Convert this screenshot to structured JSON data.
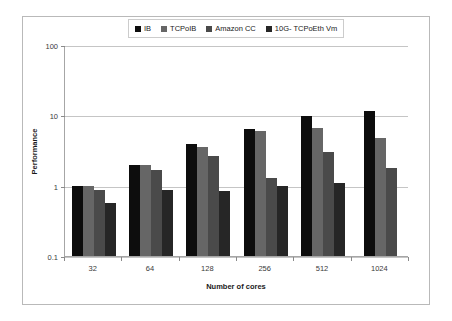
{
  "chart_data": {
    "type": "bar",
    "title": "",
    "subtitle": "",
    "xlabel": "Number of cores",
    "ylabel": "Performance",
    "categories": [
      "32",
      "64",
      "128",
      "256",
      "512",
      "1024"
    ],
    "yscale": "log",
    "ylim": [
      0.1,
      100
    ],
    "yticks": [
      "0.1",
      "1",
      "10",
      "100"
    ],
    "ytick_values": [
      0.1,
      1,
      10,
      100
    ],
    "grid": true,
    "legend_position": "top-center",
    "series": [
      {
        "name": "IB",
        "color": "#0d0d0d",
        "values": [
          1.0,
          2.0,
          3.9,
          6.3,
          9.9,
          11.7
        ]
      },
      {
        "name": "TCPoIB",
        "color": "#666666",
        "values": [
          1.0,
          1.95,
          3.6,
          5.9,
          6.7,
          4.7
        ]
      },
      {
        "name": "Amazon CC",
        "color": "#4a4a4a",
        "values": [
          0.88,
          1.65,
          2.6,
          1.3,
          3.0,
          1.8
        ]
      },
      {
        "name": "10G- TCPoEth Vm",
        "color": "#262626",
        "values": [
          0.57,
          0.88,
          0.83,
          0.98,
          1.1,
          null
        ]
      }
    ]
  },
  "legend": {
    "entries": [
      {
        "label": "IB",
        "color": "#0d0d0d"
      },
      {
        "label": "TCPoIB",
        "color": "#666666"
      },
      {
        "label": "Amazon CC",
        "color": "#4a4a4a"
      },
      {
        "label": "10G- TCPoEth Vm",
        "color": "#262626"
      }
    ]
  },
  "axes": {
    "y_title": "Performance",
    "x_title": "Number of cores",
    "y_tick_labels": [
      "100",
      "10",
      "1",
      "0.1"
    ],
    "x_tick_labels": [
      "32",
      "64",
      "128",
      "256",
      "512",
      "1024"
    ]
  }
}
